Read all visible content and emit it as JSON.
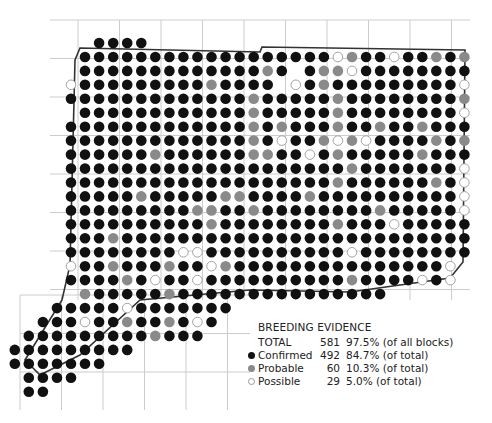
{
  "map": {
    "grid": {
      "x0": 71,
      "y0": 43,
      "dx": 14.05,
      "dy": 13.95,
      "dot_r": 5.3
    },
    "colors": {
      "confirmed": "#111111",
      "probable": "#8a8a8a",
      "possible_stroke": "#999999",
      "grid_line": "#cccccc",
      "border": "#333333",
      "county_line": "#888888"
    },
    "legend_codes": {
      "C": "confirmed",
      "P": "probable",
      "O": "possible"
    },
    "rows": [
      "..CCCC.......................",
      ".CCCCCCCCCCCCCCCCCCOPCCOCCPCP",
      ".CCCCCCCCCCCCCPC.CPPOCCCCCCCC",
      "OCCCCCCCCCPCCCC.OCPCCCCCCCCCO",
      "CCCCCCCCCCCCCPCCCCCPCCCCCCCCP",
      ".CCCCCCCCCCCCPCCCCCPCCCCCCCCO",
      "CCCCCCCCCCCCCPCPCCCPCCPCCPCCC",
      "CCCCCCCCCCCCCPCOCCPOPOCCCCPCP",
      "CCCCCCPCCCCCCPPCCOCPCCCCCPCCC",
      "CCCCCCCCCCCCCCCCCCCCPCCCCCCCO",
      "CCCCCCCCCCCCCCCCCCCPCCCCCCPCO",
      "CCCCCPCCCCCPPCCCCPCCCCCCCCCCO",
      "CCCCCCCCCPPCCPCCCCCCCCPCCCCCO",
      "CCCCCCCCCCPCCCCCCCCPCCCOCCCCC",
      "CCCPCCCCCCCCCCCCCCCCCCCCCCCCC",
      "CCCCCCCCOOCCCCCCCCCCOCCCCCCCC",
      "OCCPCCCPCCOPCCCCCCCCCCCCCCCO.",
      "CCCCPCOCCOCCCCCCCCCCPCCCCOCO.",
      ".PCCCCCPCCCCCCCCCCCCCCC......",
      "CCCCCOCCCCCCC................",
      "CCCOCCPCCPCOC................",
      "CCCCCCCCCPCCC................",
      "CCCCCCCCC....................",
      "CCCCCCC......................",
      "CCCC.........................",
      "CC..........................."
    ],
    "row_offsets": [
      2,
      1,
      1,
      1,
      1,
      1,
      1,
      1,
      1,
      1,
      1,
      1,
      1,
      1,
      1,
      1,
      1,
      1,
      1,
      -1,
      -2,
      -3,
      -4,
      -4,
      -3,
      -3
    ]
  },
  "legend": {
    "title": "BREEDING EVIDENCE",
    "total": {
      "label": "TOTAL",
      "count": "581",
      "pct": "97.5% (of all blocks)"
    },
    "items": [
      {
        "key": "confirmed",
        "label": "Confirmed",
        "count": "492",
        "pct": "84.7% (of total)"
      },
      {
        "key": "probable",
        "label": "Probable",
        "count": "60",
        "pct": "10.3% (of total)"
      },
      {
        "key": "possible",
        "label": "Possible",
        "count": "29",
        "pct": "5.0% (of total)"
      }
    ]
  }
}
